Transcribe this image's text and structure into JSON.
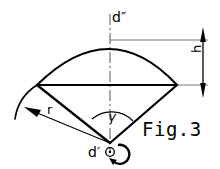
{
  "figure": {
    "caption": "Fig.3",
    "type": "engineering-drawing",
    "line_color": "#000000",
    "background_color": "#ffffff",
    "labels": {
      "diameter_top": "d″",
      "diameter_bottom": "d′",
      "segment_height": "h",
      "radius": "r",
      "sector_angle": "γ"
    },
    "annotations": {
      "center_mark": "center-point",
      "rotation_indicator": "rotation-arrow",
      "centerline_style": "dash-dot",
      "dimension_arrows": "double-headed"
    },
    "geometry": {
      "apex_x": 110,
      "apex_y": 143,
      "left_vertex_x": 37,
      "left_vertex_y": 85,
      "right_vertex_x": 177,
      "right_vertex_y": 85,
      "arc_apex_x": 110,
      "arc_apex_y": 40,
      "chord_y": 85,
      "dimension_line_x": 203,
      "angle_arc_radius": 30
    }
  }
}
